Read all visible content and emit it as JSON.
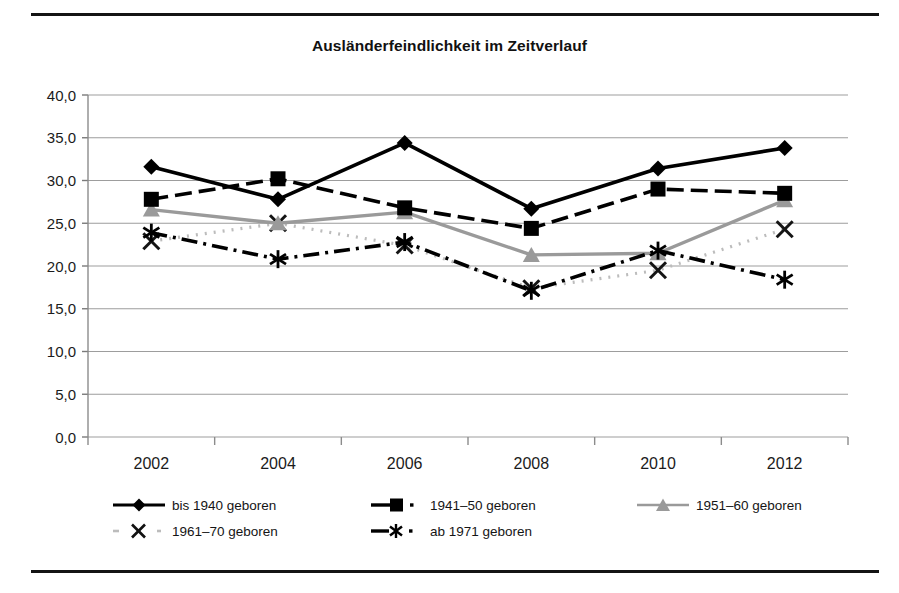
{
  "chart_data": {
    "type": "line",
    "title": "Ausländerfeindlichkeit im Zeitverlauf",
    "xlabel": "",
    "ylabel": "",
    "categories": [
      "2002",
      "2004",
      "2006",
      "2008",
      "2010",
      "2012"
    ],
    "x": [
      2002,
      2004,
      2006,
      2008,
      2010,
      2012
    ],
    "ylim": [
      0.0,
      40.0
    ],
    "ytick_step": 5.0,
    "ytick_labels": [
      "0,0",
      "5,0",
      "10,0",
      "15,0",
      "20,0",
      "25,0",
      "30,0",
      "35,0",
      "40,0"
    ],
    "ytick_values": [
      0.0,
      5.0,
      10.0,
      15.0,
      20.0,
      25.0,
      30.0,
      35.0,
      40.0
    ],
    "grid": "horizontal",
    "legend_position": "bottom",
    "series": [
      {
        "name": "bis 1940 geboren",
        "marker": "diamond",
        "line_style": "solid",
        "color": "#000000",
        "values": [
          31.6,
          27.8,
          34.4,
          26.7,
          31.4,
          33.8
        ]
      },
      {
        "name": "1941–50 geboren",
        "marker": "square",
        "line_style": "dashed",
        "color": "#000000",
        "values": [
          27.8,
          30.2,
          26.8,
          24.4,
          29.0,
          28.5
        ]
      },
      {
        "name": "1951–60 geboren",
        "marker": "triangle",
        "line_style": "solid",
        "color": "#9a9a9a",
        "values": [
          26.6,
          25.0,
          26.3,
          21.3,
          21.5,
          27.7
        ]
      },
      {
        "name": "1961–70 geboren",
        "marker": "x",
        "line_style": "dotted",
        "color": "#bcbcbc",
        "values": [
          22.9,
          25.0,
          22.4,
          17.4,
          19.5,
          24.3
        ]
      },
      {
        "name": "ab 1971 geboren",
        "marker": "asterisk",
        "line_style": "dashdot",
        "color": "#000000",
        "values": [
          23.9,
          20.8,
          22.8,
          17.1,
          21.8,
          18.4
        ]
      }
    ]
  },
  "legend": {
    "entries": [
      {
        "label": "bis 1940 geboren"
      },
      {
        "label": "1941–50 geboren"
      },
      {
        "label": "1951–60 geboren"
      },
      {
        "label": "1961–70 geboren"
      },
      {
        "label": "ab 1971 geboren"
      }
    ]
  }
}
